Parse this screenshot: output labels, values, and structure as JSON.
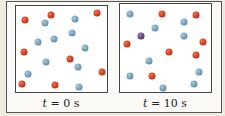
{
  "colors": {
    "red_particle": "#c83818",
    "blue_particle": "#6a9ab2",
    "purple_particle": "#5e4272",
    "background": "#efeae0",
    "frame": "#444444"
  },
  "panels": [
    {
      "caption_var": "t",
      "caption_rest": " = 0 s",
      "particles": {
        "red": [
          [
            25,
            20
          ],
          [
            51,
            15
          ],
          [
            97,
            13
          ],
          [
            24,
            52
          ],
          [
            70,
            59
          ],
          [
            102,
            72
          ],
          [
            22,
            84
          ],
          [
            55,
            85
          ]
        ],
        "blue": [
          [
            45,
            23
          ],
          [
            75,
            19
          ],
          [
            72,
            33
          ],
          [
            38,
            42
          ],
          [
            54,
            39
          ],
          [
            85,
            48
          ],
          [
            46,
            62
          ],
          [
            78,
            67
          ],
          [
            28,
            74
          ],
          [
            79,
            87
          ]
        ],
        "purple": []
      }
    },
    {
      "caption_var": "t",
      "caption_rest": " = 10 s",
      "particles": {
        "red": [
          [
            162,
            14
          ],
          [
            196,
            15
          ],
          [
            127,
            44
          ],
          [
            203,
            42
          ],
          [
            169,
            52
          ],
          [
            196,
            55
          ],
          [
            152,
            76
          ]
        ],
        "blue": [
          [
            130,
            14
          ],
          [
            184,
            22
          ],
          [
            155,
            28
          ],
          [
            184,
            36
          ],
          [
            149,
            61
          ],
          [
            130,
            76
          ],
          [
            199,
            72
          ],
          [
            194,
            84
          ],
          [
            163,
            88
          ]
        ],
        "purple": [
          [
            141,
            36
          ]
        ]
      }
    }
  ]
}
